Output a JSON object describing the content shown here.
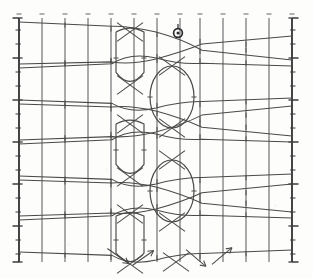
{
  "figure": {
    "kind": "flux-surface-poincare-plot",
    "title": "",
    "background_color": "#fdfdfc",
    "ink_color": "#4a4a48",
    "grid_color": "#56565a",
    "axis_color": "#3a3a3c",
    "frame": {
      "x0": 19,
      "x1": 292,
      "y0": 18,
      "y1": 262
    }
  },
  "chart_data": {
    "type": "line",
    "title": "",
    "xlabel": "",
    "ylabel": "",
    "grid": true,
    "legend": null,
    "xlim": [
      19,
      292
    ],
    "ylim": [
      18,
      262
    ],
    "vertical_gridlines": {
      "count": 13,
      "x_positions": [
        19,
        42,
        65,
        88,
        111,
        134,
        157,
        180,
        200,
        223,
        246,
        269,
        292
      ],
      "top": 18,
      "bottom": 262,
      "tick_top_marks": true
    },
    "left_axis": {
      "x": 19,
      "y_from": 18,
      "y_to": 262,
      "tick_y_positions": [
        18,
        30,
        44,
        58,
        72,
        86,
        100,
        114,
        128,
        142,
        156,
        170,
        184,
        198,
        212,
        226,
        240,
        254,
        262
      ],
      "major_tick_y_positions": [
        18,
        58,
        100,
        142,
        184,
        226,
        262
      ],
      "tick_length": 5
    },
    "right_axis": {
      "x": 292,
      "y_from": 18,
      "y_to": 262,
      "tick_y_positions": [
        18,
        30,
        44,
        58,
        72,
        86,
        100,
        114,
        128,
        142,
        156,
        170,
        184,
        198,
        212,
        226,
        240,
        254,
        262
      ],
      "major_tick_y_positions": [
        18,
        58,
        100,
        142,
        184,
        226,
        262
      ],
      "tick_length": 5
    },
    "islands": [
      {
        "name": "island-upper",
        "cx": 172,
        "cy": 97,
        "rx": 22,
        "ry": 31
      },
      {
        "name": "island-lower",
        "cx": 172,
        "cy": 191,
        "rx": 22,
        "ry": 31
      },
      {
        "name": "lobe-upper",
        "cx": 130,
        "cy": 58,
        "rx": 14,
        "ry": 26
      },
      {
        "name": "lobe-middle",
        "cx": 130,
        "cy": 150,
        "rx": 14,
        "ry": 26
      },
      {
        "name": "lobe-lower",
        "cx": 130,
        "cy": 240,
        "rx": 14,
        "ry": 24
      }
    ],
    "o_point_marker": {
      "cx": 178,
      "cy": 33,
      "r": 4.4,
      "style": "circle-with-cross"
    },
    "x_point_crossings": [
      {
        "x": 130,
        "y": 32
      },
      {
        "x": 130,
        "y": 85
      },
      {
        "x": 130,
        "y": 124
      },
      {
        "x": 130,
        "y": 177
      },
      {
        "x": 130,
        "y": 214
      },
      {
        "x": 130,
        "y": 264
      },
      {
        "x": 172,
        "y": 66
      },
      {
        "x": 172,
        "y": 128
      },
      {
        "x": 172,
        "y": 160
      },
      {
        "x": 172,
        "y": 222
      },
      {
        "x": 176,
        "y": 262
      }
    ],
    "field_lines": [
      {
        "name": "line-01",
        "y_left": 22,
        "y_right": 60,
        "shape": "straight-fan"
      },
      {
        "name": "line-02",
        "y_left": 64,
        "y_right": 36,
        "shape": "straight-fan"
      },
      {
        "name": "line-03",
        "y_left": 68,
        "y_right": 66,
        "shape": "straight-fan"
      },
      {
        "name": "line-04",
        "y_left": 100,
        "y_right": 98,
        "shape": "straight-fan"
      },
      {
        "name": "line-05",
        "y_left": 104,
        "y_right": 136,
        "shape": "straight-fan"
      },
      {
        "name": "line-06",
        "y_left": 140,
        "y_right": 106,
        "shape": "straight-fan"
      },
      {
        "name": "line-07",
        "y_left": 144,
        "y_right": 142,
        "shape": "straight-fan"
      },
      {
        "name": "line-08",
        "y_left": 176,
        "y_right": 174,
        "shape": "straight-fan"
      },
      {
        "name": "line-09",
        "y_left": 180,
        "y_right": 212,
        "shape": "straight-fan"
      },
      {
        "name": "line-10",
        "y_left": 216,
        "y_right": 184,
        "shape": "straight-fan"
      },
      {
        "name": "line-11",
        "y_left": 220,
        "y_right": 218,
        "shape": "straight-fan"
      },
      {
        "name": "line-12",
        "y_left": 252,
        "y_right": 250,
        "shape": "straight-fan"
      }
    ],
    "arrow_markers_bottom": [
      {
        "x": 118,
        "y": 256,
        "angle": 35
      },
      {
        "x": 143,
        "y": 258,
        "angle": -35
      },
      {
        "x": 196,
        "y": 258,
        "angle": 40
      },
      {
        "x": 222,
        "y": 256,
        "angle": -40
      }
    ],
    "tick_marks_on_curves": {
      "description": "short perpendicular hatch marks placed where field lines cross vertical gridlines",
      "length": 5
    }
  }
}
